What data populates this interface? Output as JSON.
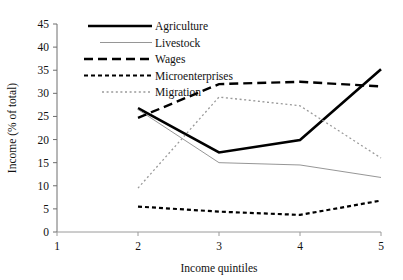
{
  "chart_data": {
    "type": "line",
    "title": "",
    "xlabel": "Income quintiles",
    "ylabel": "Income (% of total)",
    "x": [
      1,
      2,
      3,
      4,
      5
    ],
    "categories": [
      "1",
      "2",
      "3",
      "4",
      "5"
    ],
    "xlim": [
      1,
      5
    ],
    "ylim": [
      0,
      45
    ],
    "yticks": [
      0,
      5,
      10,
      15,
      20,
      25,
      30,
      35,
      40,
      45
    ],
    "xticks": [
      1,
      2,
      3,
      4,
      5
    ],
    "grid": false,
    "legend_position": "top-center",
    "series": [
      {
        "name": "Agriculture",
        "style": "solid-thick",
        "color": "#000000",
        "x": [
          2,
          3,
          4,
          5
        ],
        "values": [
          26.8,
          17.2,
          19.9,
          35.2
        ]
      },
      {
        "name": "Livestock",
        "style": "solid-thin",
        "color": "#8a8a8a",
        "x": [
          2,
          3,
          4,
          5
        ],
        "values": [
          26.5,
          15.0,
          14.5,
          11.8
        ]
      },
      {
        "name": "Wages",
        "style": "long-dash",
        "color": "#000000",
        "x": [
          2,
          3,
          4,
          5
        ],
        "values": [
          24.7,
          32.0,
          32.5,
          31.5
        ]
      },
      {
        "name": "Microenterprises",
        "style": "short-dash",
        "color": "#000000",
        "x": [
          2,
          3,
          4,
          5
        ],
        "values": [
          5.5,
          4.4,
          3.7,
          6.8
        ]
      },
      {
        "name": "Migration",
        "style": "dotted",
        "color": "#9a9a9a",
        "x": [
          2,
          3,
          4,
          5
        ],
        "values": [
          9.5,
          29.2,
          27.3,
          16.0
        ]
      }
    ]
  },
  "axes": {
    "y_tick_labels": [
      "0",
      "5",
      "10",
      "15",
      "20",
      "25",
      "30",
      "35",
      "40",
      "45"
    ],
    "x_tick_labels": [
      "1",
      "2",
      "3",
      "4",
      "5"
    ],
    "x_axis_title": "Income quintiles",
    "y_axis_title": "Income (% of total)"
  },
  "legend": {
    "items": [
      {
        "label": "Agriculture"
      },
      {
        "label": "Livestock"
      },
      {
        "label": "Wages"
      },
      {
        "label": "Microenterprises"
      },
      {
        "label": "Migration"
      }
    ]
  }
}
